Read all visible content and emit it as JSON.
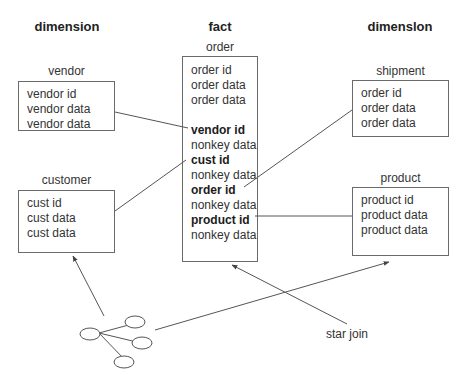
{
  "headings": {
    "left": "dimension",
    "center": "fact",
    "right": "dimenslon"
  },
  "tables": {
    "vendor": {
      "title": "vendor",
      "rows": [
        "vendor id",
        "vendor data",
        "vendor data"
      ]
    },
    "customer": {
      "title": "customer",
      "rows": [
        "cust id",
        "cust data",
        "cust data"
      ]
    },
    "order": {
      "title": "order",
      "rows": [
        "order id",
        "order data",
        "order data",
        "",
        "vendor id",
        "nonkey data",
        "cust id",
        "nonkey data",
        "order id",
        "nonkey data",
        "product id",
        "nonkey data"
      ],
      "key_rows": [
        4,
        6,
        8,
        10
      ]
    },
    "shipment": {
      "title": "shipment",
      "rows": [
        "order id",
        "order data",
        "order data"
      ]
    },
    "product": {
      "title": "product",
      "rows": [
        "product id",
        "product data",
        "product data"
      ]
    }
  },
  "annotations": {
    "star_join": "star join"
  },
  "icons": {
    "network": "network-graph-icon"
  },
  "colors": {
    "line": "#555555",
    "border": "#6a6a6a",
    "text": "#333333"
  }
}
